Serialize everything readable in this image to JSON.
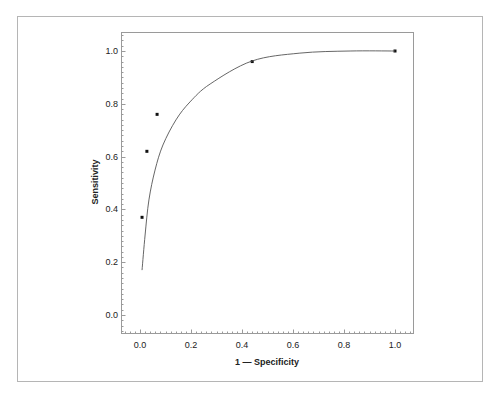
{
  "chart_data": {
    "type": "scatter",
    "title": "",
    "xlabel": "1 — Specificity",
    "ylabel": "Sensitivity",
    "xlim": [
      -0.075,
      1.075
    ],
    "ylim": [
      -0.07,
      1.07
    ],
    "grid": false,
    "legend": null,
    "x_ticks": [
      0.0,
      0.2,
      0.4,
      0.6,
      0.8,
      1.0
    ],
    "x_tick_labels": [
      "0.0",
      "0.2",
      "0.4",
      "0.6",
      "0.8",
      "1.0"
    ],
    "y_ticks": [
      0.0,
      0.2,
      0.4,
      0.6,
      0.8,
      1.0
    ],
    "y_tick_labels": [
      "0.0",
      "0.2",
      "0.4",
      "0.6",
      "0.8",
      "1.0"
    ],
    "series": [
      {
        "name": "observed points",
        "type": "scatter",
        "x": [
          0.008,
          0.027,
          0.067,
          0.44,
          1.0
        ],
        "y": [
          0.37,
          0.62,
          0.76,
          0.96,
          1.0
        ]
      },
      {
        "name": "fitted ROC curve",
        "type": "line",
        "x": [
          0.008,
          0.02,
          0.035,
          0.059,
          0.09,
          0.141,
          0.196,
          0.275,
          0.439,
          0.627,
          0.824,
          1.0
        ],
        "y": [
          0.17,
          0.303,
          0.436,
          0.549,
          0.644,
          0.739,
          0.807,
          0.875,
          0.962,
          0.992,
          1.0,
          1.0
        ]
      }
    ]
  },
  "colors": {
    "line": "#555555",
    "point": "#111111",
    "frame": "#9a9a9a",
    "outer_frame": "#b5b5b5"
  }
}
